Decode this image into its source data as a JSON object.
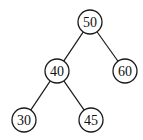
{
  "diagram": {
    "type": "binary-tree",
    "radius": 12,
    "colors": {
      "stroke": "#1a1a1a",
      "fill": "#ffffff",
      "text": "#111111"
    },
    "nodes": [
      {
        "id": "n50",
        "label": "50",
        "x": 90,
        "y": 22
      },
      {
        "id": "n40",
        "label": "40",
        "x": 57,
        "y": 71
      },
      {
        "id": "n60",
        "label": "60",
        "x": 125,
        "y": 71
      },
      {
        "id": "n30",
        "label": "30",
        "x": 24,
        "y": 120
      },
      {
        "id": "n45",
        "label": "45",
        "x": 91,
        "y": 120
      }
    ],
    "edges": [
      {
        "from": "n50",
        "to": "n40"
      },
      {
        "from": "n50",
        "to": "n60"
      },
      {
        "from": "n40",
        "to": "n30"
      },
      {
        "from": "n40",
        "to": "n45"
      }
    ]
  }
}
